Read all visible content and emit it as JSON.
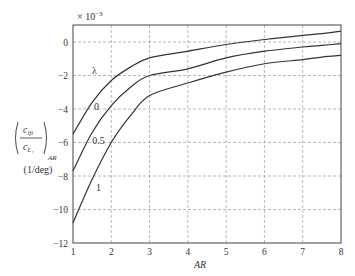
{
  "chart_data": {
    "type": "line",
    "title": "",
    "multiplier_label": "× 10",
    "multiplier_exp": "−3",
    "xlabel": "AR",
    "ylabel": "(c_lβ / c_L1)_AR (1/deg)",
    "ylabel_parts": {
      "num": "c",
      "num_sub": "lβ",
      "den": "c",
      "den_sub": "L₁",
      "subscript": "AR",
      "units": "(1/deg)"
    },
    "legend_title": "λ",
    "xlim": [
      1,
      8
    ],
    "ylim": [
      -12,
      1
    ],
    "x_ticks": [
      1,
      2,
      3,
      4,
      5,
      6,
      7,
      8
    ],
    "y_ticks": [
      0,
      -2,
      -4,
      -6,
      -8,
      -10,
      -12
    ],
    "y_tick_labels": [
      "0",
      "−2",
      "−4",
      "−6",
      "−8",
      "−10",
      "−12"
    ],
    "grid": true,
    "x": [
      1,
      1.5,
      2,
      2.5,
      3,
      4,
      5,
      6,
      7,
      7.5,
      8
    ],
    "series": [
      {
        "name": "0",
        "values": [
          -5.5,
          -3.6,
          -2.3,
          -1.5,
          -0.95,
          -0.55,
          -0.15,
          0.15,
          0.4,
          0.5,
          0.65
        ]
      },
      {
        "name": "0.5",
        "values": [
          -7.7,
          -5.4,
          -3.8,
          -2.7,
          -2.0,
          -1.6,
          -0.95,
          -0.55,
          -0.3,
          -0.2,
          -0.1
        ]
      },
      {
        "name": "1",
        "values": [
          -10.8,
          -8.2,
          -6.0,
          -4.4,
          -3.2,
          -2.45,
          -1.8,
          -1.3,
          -1.05,
          -0.9,
          -0.8
        ]
      }
    ],
    "curve_labels": [
      {
        "text": "0",
        "x": 1.55,
        "y": -4.05
      },
      {
        "text": "0.5",
        "x": 1.5,
        "y": -6.1
      },
      {
        "text": "1",
        "x": 1.6,
        "y": -8.9
      }
    ]
  }
}
